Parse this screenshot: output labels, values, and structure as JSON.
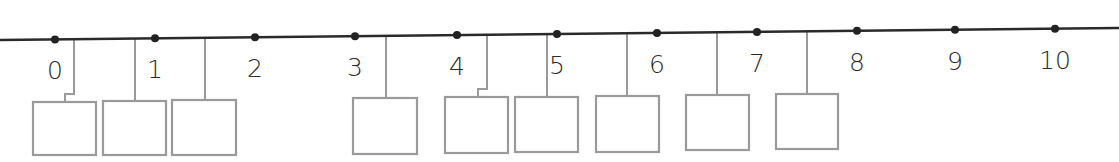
{
  "diagram": {
    "type": "number-line-with-answer-boxes",
    "line": {
      "x1": 0,
      "y1": 40,
      "x2": 1119,
      "y2": 28,
      "color": "#2a2a2a"
    },
    "ticks": [
      {
        "value": "0",
        "x": 55
      },
      {
        "value": "1",
        "x": 155
      },
      {
        "value": "2",
        "x": 255
      },
      {
        "value": "3",
        "x": 355
      },
      {
        "value": "4",
        "x": 457
      },
      {
        "value": "5",
        "x": 557
      },
      {
        "value": "6",
        "x": 657
      },
      {
        "value": "7",
        "x": 757
      },
      {
        "value": "8",
        "x": 857
      },
      {
        "value": "9",
        "x": 955
      },
      {
        "value": "10",
        "x": 1055
      }
    ],
    "answer_boxes": [
      {
        "id": 1,
        "connector_x": 74,
        "jog_to_x": 65,
        "box_x": 33,
        "box_y": 102,
        "w": 63,
        "h": 53,
        "value": ""
      },
      {
        "id": 2,
        "connector_x": 135,
        "box_x": 103,
        "box_y": 101,
        "w": 63,
        "h": 54,
        "value": ""
      },
      {
        "id": 3,
        "connector_x": 205,
        "box_x": 172,
        "box_y": 100,
        "w": 64,
        "h": 55,
        "value": ""
      },
      {
        "id": 4,
        "connector_x": 386,
        "box_x": 353,
        "box_y": 98,
        "w": 64,
        "h": 56,
        "value": ""
      },
      {
        "id": 5,
        "connector_x": 487,
        "jog_to_x": 478,
        "box_x": 445,
        "box_y": 97,
        "w": 63,
        "h": 56,
        "value": ""
      },
      {
        "id": 6,
        "connector_x": 547,
        "box_x": 515,
        "box_y": 97,
        "w": 63,
        "h": 55,
        "value": ""
      },
      {
        "id": 7,
        "connector_x": 627,
        "box_x": 596,
        "box_y": 96,
        "w": 63,
        "h": 56,
        "value": ""
      },
      {
        "id": 8,
        "connector_x": 717,
        "box_x": 686,
        "box_y": 95,
        "w": 63,
        "h": 55,
        "value": ""
      },
      {
        "id": 9,
        "connector_x": 807,
        "box_x": 776,
        "box_y": 94,
        "w": 62,
        "h": 55,
        "value": ""
      }
    ],
    "colors": {
      "line": "#2a2a2a",
      "dot": "#222222",
      "connector": "#9a9a9a",
      "box": "#9a9a9a",
      "label": "#2b2b2b"
    }
  }
}
